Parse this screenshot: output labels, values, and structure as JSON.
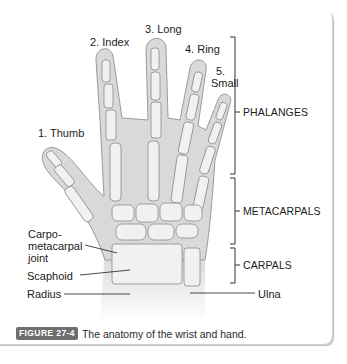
{
  "figure": {
    "badge": "FIGURE 27-4",
    "caption": "The anatomy of the wrist and hand."
  },
  "fingers": [
    {
      "label": "1. Thumb"
    },
    {
      "label": "2. Index"
    },
    {
      "label": "3. Long"
    },
    {
      "label": "4. Ring"
    },
    {
      "label_line1": "5.",
      "label_line2": "Small"
    }
  ],
  "brackets": [
    {
      "label": "PHALANGES"
    },
    {
      "label": "METACARPALS"
    },
    {
      "label": "CARPALS"
    }
  ],
  "left_labels": {
    "cmc_line1": "Carpo-",
    "cmc_line2": "metacarpal",
    "cmc_line3": "joint",
    "scaphoid": "Scaphoid",
    "radius": "Radius"
  },
  "right_labels": {
    "ulna": "Ulna"
  },
  "colors": {
    "skin": "#d9d9d9",
    "bone": "#f1f1f1",
    "outline": "#8a8a8a",
    "badge": "#6e6e6e"
  }
}
